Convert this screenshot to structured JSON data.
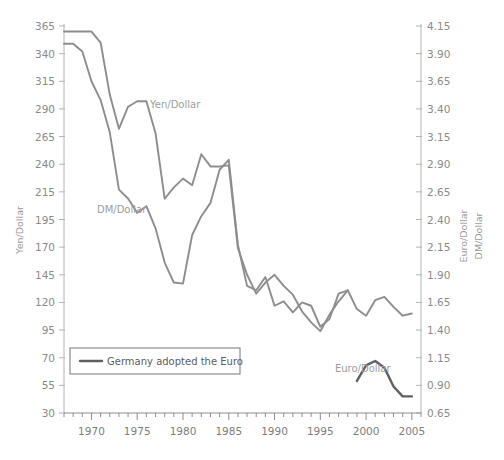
{
  "chart_data": {
    "type": "line",
    "title": "",
    "subtitle": "",
    "xlabel": "",
    "ylabel": "Yen/Dollar",
    "ylabel_right_1": "Euro/Dollar",
    "ylabel_right_2": "DM/Dollar",
    "grid": false,
    "legend_position": "inside-lower-left",
    "xlim": [
      1967,
      2006
    ],
    "x_major_ticks": [
      1970,
      1975,
      1980,
      1985,
      1990,
      1995,
      2000,
      2005
    ],
    "x_major_tick_labels": [
      "1970",
      "1975",
      "1980",
      "1985",
      "1990",
      "1995",
      "2000",
      "2005"
    ],
    "x_minor_tick_step": 1,
    "left_axis": {
      "name": "Yen/Dollar",
      "ticks": [
        365,
        340,
        315,
        290,
        265,
        240,
        215,
        195,
        170,
        145,
        120,
        95,
        70,
        55,
        30
      ],
      "tick_labels": [
        "365",
        "340",
        "315",
        "290",
        "265",
        "240",
        "215",
        "195",
        "170",
        "145",
        "120",
        "95",
        "70",
        "55",
        "30"
      ],
      "ylim": [
        30,
        365
      ]
    },
    "right_axis": {
      "names": [
        "Euro/Dollar",
        "DM/Dollar"
      ],
      "ticks": [
        4.15,
        3.9,
        3.65,
        3.4,
        3.15,
        2.9,
        2.65,
        2.4,
        2.15,
        1.9,
        1.65,
        1.4,
        1.15,
        0.9,
        0.65
      ],
      "tick_labels": [
        "4.15",
        "3.90",
        "3.65",
        "3.40",
        "3.15",
        "2.90",
        "2.65",
        "2.40",
        "2.15",
        "1.90",
        "1.65",
        "1.40",
        "1.15",
        "0.90",
        "0.65"
      ],
      "ylim": [
        0.65,
        4.15
      ]
    },
    "annotations": [
      {
        "name": "yen-dollar-label",
        "text": "Yen/Dollar",
        "x": 1976.4,
        "y_px": 108
      },
      {
        "name": "dm-dollar-label",
        "text": "DM/Dollar",
        "x": 1970.6,
        "y_px": 213
      },
      {
        "name": "euro-dollar-label",
        "text": "Euro/Dollar",
        "x": 1996.6,
        "y_px": 372
      }
    ],
    "legend": {
      "entries": [
        {
          "label": "Germany adopted the Euro",
          "color": "#5f5f5f"
        }
      ]
    },
    "series": [
      {
        "name": "Yen/Dollar",
        "axis": "left",
        "color": "#8d8d8d",
        "x": [
          1967,
          1968,
          1969,
          1970,
          1971,
          1972,
          1973,
          1974,
          1975,
          1976,
          1977,
          1978,
          1979,
          1980,
          1981,
          1982,
          1983,
          1984,
          1985,
          1986,
          1987,
          1988,
          1989,
          1990,
          1991,
          1992,
          1993,
          1994,
          1995,
          1996,
          1997,
          1998,
          1999,
          2000,
          2001,
          2002,
          2003,
          2004,
          2005
        ],
        "values": [
          360,
          360,
          360,
          360,
          350,
          303,
          272,
          292,
          297,
          297,
          268,
          210,
          219,
          227,
          221,
          249,
          238,
          238,
          239,
          169,
          145,
          128,
          138,
          145,
          135,
          127,
          112,
          102,
          94,
          109,
          121,
          131,
          114,
          108,
          122,
          125,
          116,
          108,
          110
        ]
      },
      {
        "name": "DM/Dollar",
        "axis": "right",
        "color": "#8d8d8d",
        "x": [
          1967,
          1968,
          1969,
          1970,
          1971,
          1972,
          1973,
          1974,
          1975,
          1976,
          1977,
          1978,
          1979,
          1980,
          1981,
          1982,
          1983,
          1984,
          1985,
          1986,
          1987,
          1988,
          1989,
          1990,
          1991,
          1992,
          1993,
          1994,
          1995,
          1996,
          1997,
          1998
        ],
        "values": [
          3.99,
          3.99,
          3.92,
          3.65,
          3.48,
          3.19,
          2.67,
          2.59,
          2.46,
          2.52,
          2.32,
          2.01,
          1.83,
          1.82,
          2.26,
          2.43,
          2.55,
          2.85,
          2.94,
          2.17,
          1.8,
          1.76,
          1.88,
          1.62,
          1.66,
          1.56,
          1.65,
          1.62,
          1.43,
          1.5,
          1.73,
          1.76
        ]
      },
      {
        "name": "Euro/Dollar",
        "axis": "right",
        "color": "#5f5f5f",
        "x": [
          1999,
          2000,
          2001,
          2002,
          2003,
          2004,
          2005
        ],
        "values": [
          0.94,
          1.08,
          1.12,
          1.06,
          0.89,
          0.8,
          0.8
        ]
      }
    ]
  }
}
